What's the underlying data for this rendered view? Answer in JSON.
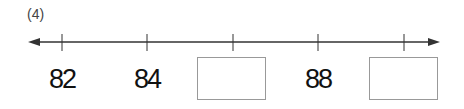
{
  "problem": {
    "label": "(4)",
    "number_line": {
      "ticks": [
        {
          "x": 62,
          "value": "82",
          "blank": false
        },
        {
          "x": 147,
          "value": "84",
          "blank": false
        },
        {
          "x": 233,
          "value": "",
          "blank": true
        },
        {
          "x": 318,
          "value": "88",
          "blank": false
        },
        {
          "x": 404,
          "value": "",
          "blank": true
        }
      ],
      "line_color": "#333333",
      "box_border_color": "#999999"
    }
  }
}
